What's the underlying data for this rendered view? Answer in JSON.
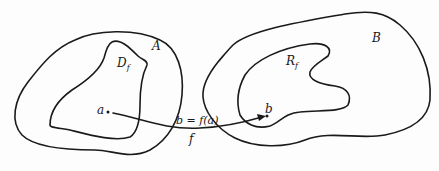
{
  "diagram": {
    "type": "function-mapping",
    "colors": {
      "stroke": "#1a1a1a",
      "background": "#fdfdfd"
    },
    "sets": {
      "domain_set": {
        "label": "A"
      },
      "domain_subset": {
        "label": "D",
        "subscript": "f"
      },
      "codomain_set": {
        "label": "B"
      },
      "range_subset": {
        "label": "R",
        "subscript": "f"
      }
    },
    "points": {
      "source": {
        "label": "a"
      },
      "target": {
        "label": "b"
      }
    },
    "mapping": {
      "equation": "b = f(a)",
      "function_label": "f"
    }
  }
}
